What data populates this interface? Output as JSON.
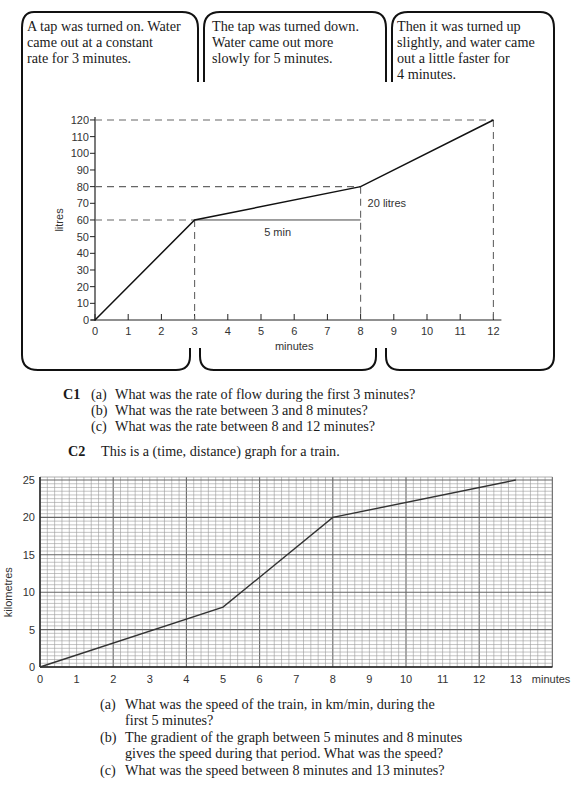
{
  "boxes": [
    {
      "lines": [
        "A tap was turned on. Water",
        "came out at a constant",
        "rate for 3 minutes."
      ]
    },
    {
      "lines": [
        "The tap was turned down.",
        "Water came out more",
        "slowly for 5 minutes."
      ]
    },
    {
      "lines": [
        "Then it was turned up",
        "slightly, and water came",
        "out a little faster for",
        "4 minutes."
      ]
    }
  ],
  "c1": {
    "label": "C1",
    "questions": [
      {
        "letter": "(a)",
        "text": "What was the rate of flow during the first 3 minutes?"
      },
      {
        "letter": "(b)",
        "text": "What was the rate between 3 and 8 minutes?"
      },
      {
        "letter": "(c)",
        "text": "What was the rate between 8 and 12 minutes?"
      }
    ]
  },
  "c2": {
    "label": "C2",
    "intro": "This is a (time, distance) graph for a train.",
    "questions": [
      {
        "letter": "(a)",
        "lines": [
          "What was the speed of the train, in km/min, during the",
          "first 5 minutes?"
        ]
      },
      {
        "letter": "(b)",
        "lines": [
          "The gradient of the graph between 5 minutes and 8 minutes",
          "gives the speed during that period. What was the speed?"
        ]
      },
      {
        "letter": "(c)",
        "lines": [
          "What was the speed between 8 minutes and 13 minutes?"
        ]
      }
    ]
  },
  "chart_data": [
    {
      "type": "line",
      "title": "",
      "xlabel": "minutes",
      "ylabel": "litres",
      "xlim": [
        0,
        12
      ],
      "ylim": [
        0,
        120
      ],
      "x_ticks": [
        "0",
        "1",
        "2",
        "3",
        "4",
        "5",
        "6",
        "7",
        "8",
        "9",
        "10",
        "11",
        "12"
      ],
      "y_ticks": [
        "0",
        "10",
        "20",
        "30",
        "40",
        "50",
        "60",
        "70",
        "80",
        "90",
        "100",
        "110",
        "120"
      ],
      "grid": false,
      "series": [
        {
          "name": "water",
          "x": [
            0,
            3,
            8,
            12
          ],
          "y": [
            0,
            60,
            80,
            120
          ]
        }
      ],
      "annotations": [
        "5 min",
        "20 litres"
      ],
      "guides": {
        "horizontal_dashed": [
          60,
          80,
          120
        ],
        "vertical_dashed": [
          3,
          8,
          12
        ]
      }
    },
    {
      "type": "line",
      "title": "",
      "xlabel": "minutes",
      "ylabel": "kilometres",
      "xlim": [
        0,
        14
      ],
      "ylim": [
        0,
        25
      ],
      "x_ticks": [
        "0",
        "1",
        "2",
        "3",
        "4",
        "5",
        "6",
        "7",
        "8",
        "9",
        "10",
        "11",
        "12",
        "13"
      ],
      "y_ticks": [
        "0",
        "5",
        "10",
        "15",
        "20",
        "25"
      ],
      "grid": true,
      "series": [
        {
          "name": "train",
          "x": [
            0,
            5,
            8,
            13
          ],
          "y": [
            0,
            8,
            20,
            25
          ]
        }
      ]
    }
  ]
}
